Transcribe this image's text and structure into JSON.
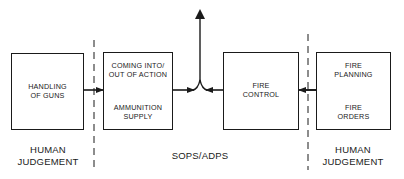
{
  "diagram": {
    "type": "block-flow",
    "colors": {
      "stroke": "#1a1a1a",
      "background": "#ffffff"
    },
    "boxes": [
      {
        "id": "handling-of-guns",
        "label": "HANDLING\nOF GUNS"
      },
      {
        "id": "coming-into-action",
        "top_label": "COMING INTO/\nOUT OF ACTION",
        "bottom_label": "AMMUNITION\nSUPPLY"
      },
      {
        "id": "fire-control",
        "label": "FIRE\nCONTROL"
      },
      {
        "id": "fire-planning",
        "top_label": "FIRE\nPLANNING",
        "bottom_label": "FIRE\nORDERS"
      }
    ],
    "zones": {
      "left": "HUMAN\nJUDGEMENT",
      "middle": "SOPS/ADPS",
      "right": "HUMAN\nJUDGEMENT"
    },
    "connections": [
      {
        "from": "handling-of-guns",
        "to": "coming-into-action",
        "style": "arrow"
      },
      {
        "from": "coming-into-action",
        "to": "junction",
        "style": "arrow"
      },
      {
        "from": "fire-control",
        "to": "junction",
        "style": "arrow"
      },
      {
        "from": "junction",
        "to": "output-up",
        "style": "arrow"
      },
      {
        "from": "fire-planning",
        "to": "fire-control",
        "style": "arrow"
      }
    ]
  }
}
